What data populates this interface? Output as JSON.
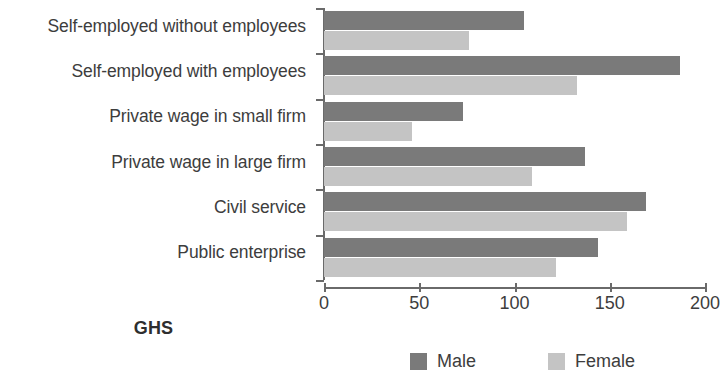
{
  "chart_data": {
    "type": "bar",
    "orientation": "horizontal",
    "title": "",
    "xlabel": "GHS",
    "ylabel": "",
    "xlim": [
      0,
      200
    ],
    "xticks": [
      0,
      50,
      100,
      150,
      200
    ],
    "xtick_labels": [
      "0",
      "50",
      "100",
      "150",
      "200"
    ],
    "grid": false,
    "legend_position": "bottom",
    "categories": [
      "Self-employed without employees",
      "Self-employed with employees",
      "Private wage in small firm",
      "Private wage in large firm",
      "Civil service",
      "Public enterprise"
    ],
    "series": [
      {
        "name": "Male",
        "color": "#7a7a7a",
        "values": [
          105,
          187,
          73,
          137,
          169,
          144
        ]
      },
      {
        "name": "Female",
        "color": "#c4c4c4",
        "values": [
          76,
          133,
          46,
          109,
          159,
          122
        ]
      }
    ]
  },
  "legend": {
    "items": [
      {
        "label": "Male",
        "swatch": "male-swatch"
      },
      {
        "label": "Female",
        "swatch": "female-swatch"
      }
    ]
  },
  "axis": {
    "x_title": "GHS"
  }
}
